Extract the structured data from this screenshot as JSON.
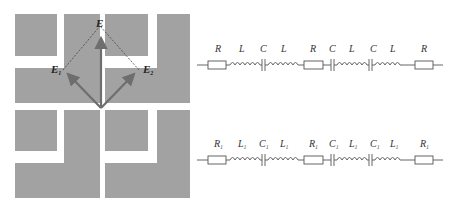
{
  "figure": {
    "pattern": {
      "fill_color": "#a2a2a2",
      "vector_color": "#6e6e6e",
      "vectors": [
        {
          "name": "E",
          "label": "E",
          "subscript": ""
        },
        {
          "name": "E1",
          "label": "E",
          "subscript": "1"
        },
        {
          "name": "E2",
          "label": "E",
          "subscript": "2"
        }
      ]
    },
    "circuits": [
      {
        "name": "top-circuit",
        "components": [
          {
            "type": "resistor",
            "label": "R",
            "subscript": ""
          },
          {
            "type": "inductor",
            "label": "L",
            "subscript": ""
          },
          {
            "type": "capacitor",
            "label": "C",
            "subscript": ""
          },
          {
            "type": "inductor",
            "label": "L",
            "subscript": ""
          },
          {
            "type": "resistor",
            "label": "R",
            "subscript": ""
          },
          {
            "type": "capacitor",
            "label": "C",
            "subscript": ""
          },
          {
            "type": "inductor",
            "label": "L",
            "subscript": ""
          },
          {
            "type": "capacitor",
            "label": "C",
            "subscript": ""
          },
          {
            "type": "inductor",
            "label": "L",
            "subscript": ""
          },
          {
            "type": "resistor",
            "label": "R",
            "subscript": ""
          }
        ]
      },
      {
        "name": "bottom-circuit",
        "components": [
          {
            "type": "resistor",
            "label": "R",
            "subscript": "1"
          },
          {
            "type": "inductor",
            "label": "L",
            "subscript": "1"
          },
          {
            "type": "capacitor",
            "label": "C",
            "subscript": "1"
          },
          {
            "type": "inductor",
            "label": "L",
            "subscript": "1"
          },
          {
            "type": "resistor",
            "label": "R",
            "subscript": "1"
          },
          {
            "type": "capacitor",
            "label": "C",
            "subscript": "1"
          },
          {
            "type": "inductor",
            "label": "L",
            "subscript": "1"
          },
          {
            "type": "capacitor",
            "label": "C",
            "subscript": "1"
          },
          {
            "type": "inductor",
            "label": "L",
            "subscript": "1"
          },
          {
            "type": "resistor",
            "label": "R",
            "subscript": "1"
          }
        ]
      }
    ]
  }
}
